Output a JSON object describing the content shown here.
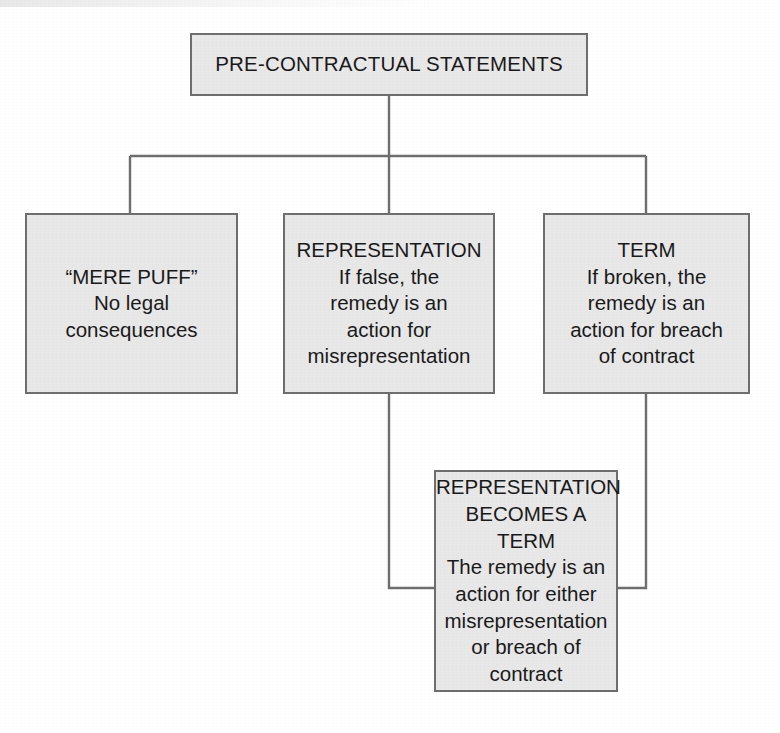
{
  "diagram": {
    "title": "PRE-CONTRACTUAL STATEMENTS",
    "type": "flowchart",
    "orientation": "top-down",
    "colors": {
      "node_fill": "#e8e8e8",
      "node_border": "#6e6e6e",
      "connector": "#6e6e6e",
      "text": "#1a1a1a",
      "background": "#ffffff"
    },
    "nodes": {
      "root": {
        "id": "pre-contractual-statements",
        "label": "PRE-CONTRACTUAL STATEMENTS",
        "level": 1
      },
      "mere_puff": {
        "id": "mere-puff",
        "heading": "“MERE PUFF”",
        "body": "No legal\nconsequences",
        "label": "“MERE PUFF”\nNo legal\nconsequences",
        "level": 2
      },
      "representation": {
        "id": "representation",
        "heading": "REPRESENTATION",
        "body": "If false, the\nremedy is an\naction for\nmisrepresentation",
        "label": "REPRESENTATION\nIf false, the\nremedy is an\naction for\nmisrepresentation",
        "level": 2
      },
      "term": {
        "id": "term",
        "heading": "TERM",
        "body": "If broken, the\nremedy is an\naction for breach\nof contract",
        "label": "TERM\nIf broken, the\nremedy is an\naction for breach\nof contract",
        "level": 2
      },
      "representation_becomes_term": {
        "id": "representation-becomes-a-term",
        "heading": "REPRESENTATION\nBECOMES A TERM",
        "body": "The remedy is an\naction for either\nmisrepresentation\nor breach of\ncontract",
        "label": "REPRESENTATION\nBECOMES A TERM\nThe remedy is an\naction for either\nmisrepresentation\nor breach of\ncontract",
        "level": 3
      }
    },
    "edges": [
      {
        "from": "pre-contractual-statements",
        "to": "mere-puff",
        "style": "orthogonal"
      },
      {
        "from": "pre-contractual-statements",
        "to": "representation",
        "style": "orthogonal"
      },
      {
        "from": "pre-contractual-statements",
        "to": "term",
        "style": "orthogonal"
      },
      {
        "from": "representation",
        "to": "representation-becomes-a-term",
        "style": "orthogonal-elbow"
      },
      {
        "from": "term",
        "to": "representation-becomes-a-term",
        "style": "orthogonal-elbow"
      }
    ]
  }
}
